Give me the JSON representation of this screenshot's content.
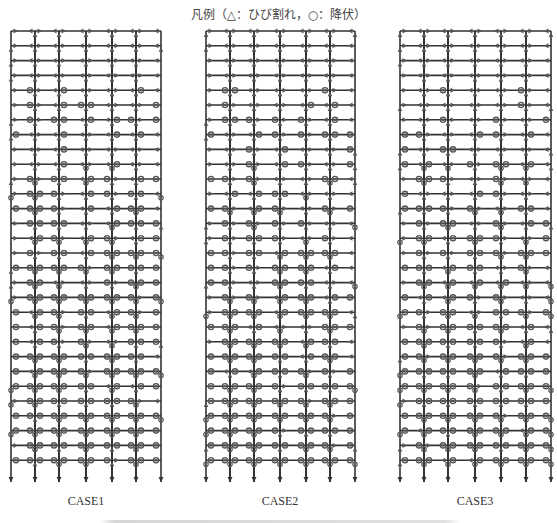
{
  "legend": {
    "text": "凡例（△：ひび割れ，○：降伏）",
    "crack_symbol": "triangle",
    "yield_symbol": "circle"
  },
  "cases": [
    {
      "label": "CASE1",
      "columns_x": [
        11,
        35,
        59,
        86,
        112,
        136,
        161
      ],
      "label_x": 86
    },
    {
      "label": "CASE2",
      "columns_x": [
        206,
        230,
        254,
        280,
        306,
        330,
        355
      ],
      "label_x": 280
    },
    {
      "label": "CASE3",
      "columns_x": [
        400,
        424,
        448,
        475,
        501,
        526,
        551
      ],
      "label_x": 475
    }
  ],
  "frame": {
    "floors": 30,
    "top_y": 31,
    "floor_spacing": 14.8,
    "column_bottom_y": 482,
    "line_color": "#333333",
    "marker_color": "#555555"
  },
  "caption": {
    "text": ""
  }
}
